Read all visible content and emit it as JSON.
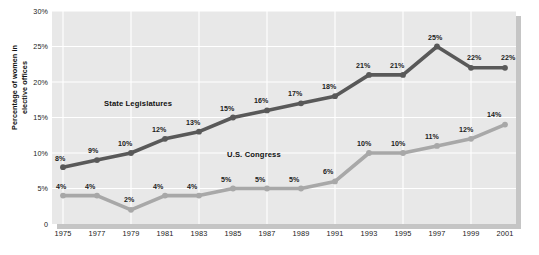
{
  "chart_data": {
    "type": "line",
    "title": "",
    "subtitle": "",
    "xlabel": "",
    "ylabel": "Percentage of women in\nelective offices",
    "x": [
      1975,
      1977,
      1979,
      1981,
      1983,
      1985,
      1987,
      1989,
      1991,
      1993,
      1995,
      1997,
      1999,
      2001
    ],
    "categories": [
      "1975",
      "1977",
      "1979",
      "1981",
      "1983",
      "1985",
      "1987",
      "1989",
      "1991",
      "1993",
      "1995",
      "1997",
      "1999",
      "2001"
    ],
    "ylim": [
      0,
      30
    ],
    "yticks": [
      0,
      5,
      10,
      15,
      20,
      25,
      30
    ],
    "ytick_labels": [
      "0",
      "5%",
      "10%",
      "15%",
      "20%",
      "25%",
      "30%"
    ],
    "grid": true,
    "grid_color": "#ffffff",
    "plot_background": "#e8e8e8",
    "legend_position": "in-plot-annotation",
    "series": [
      {
        "name": "State Legislatures",
        "color": "#595959",
        "values": [
          8,
          9,
          10,
          12,
          13,
          15,
          16,
          17,
          18,
          21,
          21,
          25,
          22,
          22
        ],
        "labels": [
          "8%",
          "9%",
          "10%",
          "12%",
          "13%",
          "15%",
          "16%",
          "17%",
          "18%",
          "21%",
          "21%",
          "25%",
          "22%",
          "22%"
        ]
      },
      {
        "name": "U.S. Congress",
        "color": "#a8a8a8",
        "values": [
          4,
          4,
          2,
          4,
          4,
          5,
          5,
          5,
          6,
          10,
          10,
          11,
          12,
          14
        ],
        "labels": [
          "4%",
          "4%",
          "2%",
          "4%",
          "4%",
          "5%",
          "5%",
          "5%",
          "6%",
          "10%",
          "10%",
          "11%",
          "12%",
          "14%"
        ]
      }
    ],
    "annotations": [
      {
        "name": "State Legislatures",
        "text": "State Legislatures"
      },
      {
        "name": "U.S. Congress",
        "text": "U.S. Congress"
      }
    ]
  }
}
